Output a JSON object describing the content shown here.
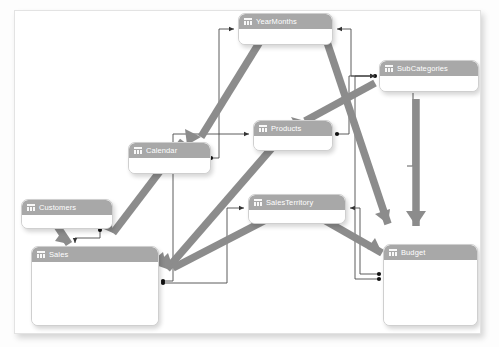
{
  "diagram": {
    "type": "entity-relationship",
    "colors": {
      "header": "#a8a8a8",
      "header_text": "#ffffff",
      "body": "#ffffff",
      "card_border": "#cfcfcf",
      "connector": "#404040",
      "filter_arrow": "#8c8c8c",
      "canvas": "#ffffff",
      "page": "#fdfdfd"
    },
    "tables": [
      {
        "id": "yearmonths",
        "label": "YearMonths",
        "icon": "table-icon",
        "x": 223,
        "y": 2,
        "w": 95,
        "h": 32
      },
      {
        "id": "subcategories",
        "label": "SubCategories",
        "icon": "table-icon",
        "x": 364,
        "y": 49,
        "w": 100,
        "h": 32
      },
      {
        "id": "products",
        "label": "Products",
        "icon": "table-icon",
        "x": 238,
        "y": 109,
        "w": 80,
        "h": 31
      },
      {
        "id": "calendar",
        "label": "Calendar",
        "icon": "table-icon",
        "x": 113,
        "y": 131,
        "w": 83,
        "h": 32
      },
      {
        "id": "customers",
        "label": "Customers",
        "icon": "table-icon",
        "x": 6,
        "y": 188,
        "w": 92,
        "h": 30
      },
      {
        "id": "salesterritory",
        "label": "SalesTerritory",
        "icon": "table-icon",
        "x": 233,
        "y": 183,
        "w": 98,
        "h": 30
      },
      {
        "id": "budget",
        "label": "Budget",
        "icon": "table-icon",
        "x": 368,
        "y": 233,
        "w": 95,
        "h": 82
      },
      {
        "id": "sales",
        "label": "Sales",
        "icon": "table-icon",
        "x": 16,
        "y": 235,
        "w": 128,
        "h": 80
      }
    ],
    "relationships": [
      {
        "from": "calendar",
        "to": "yearmonths",
        "cardinality": "many-to-one"
      },
      {
        "from": "subcategories",
        "to": "yearmonths",
        "cardinality": "many-to-one"
      },
      {
        "from": "sales",
        "to": "products",
        "cardinality": "many-to-one"
      },
      {
        "from": "products",
        "to": "subcategories",
        "cardinality": "many-to-one"
      },
      {
        "from": "customers",
        "to": "sales",
        "cardinality": "one-to-many"
      },
      {
        "from": "sales",
        "to": "salesterritory",
        "cardinality": "many-to-one"
      },
      {
        "from": "budget",
        "to": "salesterritory",
        "cardinality": "many-to-one"
      },
      {
        "from": "budget",
        "to": "subcategories",
        "cardinality": "many-to-one"
      }
    ],
    "filter_arrows": [
      {
        "from": "yearmonths",
        "to": "calendar"
      },
      {
        "from": "yearmonths",
        "to": "sales"
      },
      {
        "from": "yearmonths",
        "to": "budget"
      },
      {
        "from": "subcategories",
        "to": "products"
      },
      {
        "from": "subcategories",
        "to": "sales"
      },
      {
        "from": "subcategories",
        "to": "budget"
      },
      {
        "from": "salesterritory",
        "to": "sales"
      },
      {
        "from": "salesterritory",
        "to": "budget"
      },
      {
        "from": "customers",
        "to": "sales"
      }
    ]
  }
}
